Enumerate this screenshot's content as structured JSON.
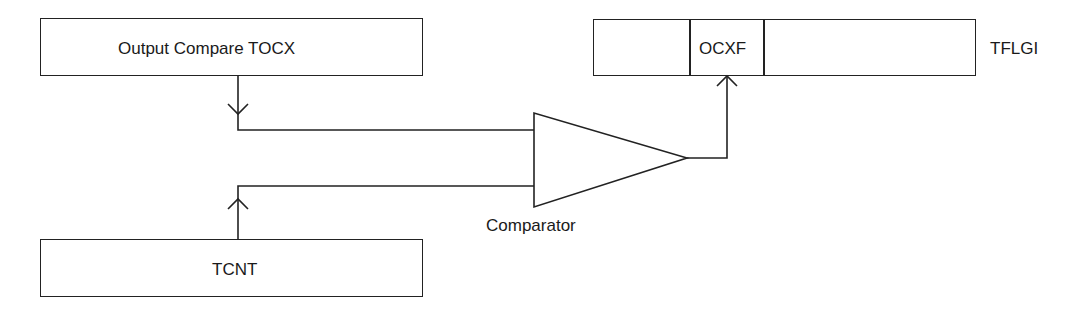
{
  "diagram": {
    "blocks": {
      "output_compare": {
        "label": "Output Compare TOCX"
      },
      "tcnt": {
        "label": "TCNT"
      },
      "comparator": {
        "label": "Comparator"
      },
      "tflgi": {
        "label": "TFLGI",
        "cells": [
          "",
          "OCXF",
          ""
        ]
      }
    },
    "connections": [
      {
        "from": "Output Compare TOCX",
        "to": "Comparator",
        "arrow": "down"
      },
      {
        "from": "TCNT",
        "to": "Comparator",
        "arrow": "up"
      },
      {
        "from": "Comparator",
        "to": "OCXF",
        "arrow": "up"
      }
    ],
    "colors": {
      "stroke": "#222222",
      "background": "#ffffff"
    }
  }
}
